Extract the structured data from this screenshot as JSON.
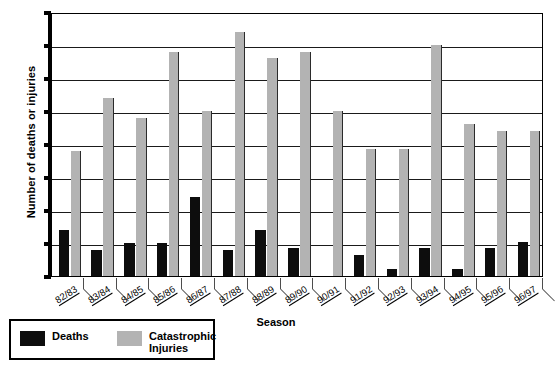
{
  "chart_data": {
    "type": "bar",
    "title": "",
    "xlabel": "Season",
    "ylabel": "Number of deaths or injuries",
    "ylim": [
      0,
      40
    ],
    "ytick_step": 5,
    "yticks": [
      0,
      5,
      10,
      15,
      20,
      25,
      30,
      35,
      40
    ],
    "grid": true,
    "legend_position": "below-left",
    "categories": [
      "82/83",
      "83/84",
      "84/85",
      "85/86",
      "86/87",
      "87/88",
      "88/89",
      "89/90",
      "90/91",
      "91/92",
      "92/93",
      "93/94",
      "94/95",
      "95/96",
      "96/97"
    ],
    "series": [
      {
        "name": "Deaths",
        "color": "#0d0d0d",
        "values": [
          7,
          4,
          5,
          5,
          12,
          4,
          7,
          4.3,
          0,
          3.2,
          1,
          4.3,
          1,
          4.3,
          5.2
        ]
      },
      {
        "name": "Catastrophic Injuries",
        "color": "#b3b3b3",
        "values": [
          19,
          27,
          24,
          34,
          25,
          37,
          33,
          34,
          25,
          19.3,
          19.3,
          35,
          23,
          22,
          22
        ]
      }
    ]
  },
  "legend": {
    "entries": [
      {
        "label": "Deaths",
        "swatch": "deaths"
      },
      {
        "label": "Catastrophic\nInjuries",
        "swatch": "injuries"
      }
    ]
  }
}
